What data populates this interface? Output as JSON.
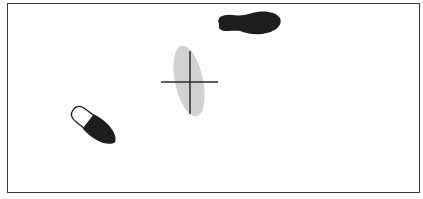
{
  "diagram": {
    "frame": {
      "border_color": "#3a3a3a",
      "background": "#ffffff"
    },
    "footprints": [
      {
        "id": "top-footprint",
        "description": "dark shoe print, horizontal, heel left, toe right",
        "fill": "#1e1e1e",
        "center": [
          246,
          23
        ]
      },
      {
        "id": "bottom-left-footprint",
        "description": "shoe print, toe region outlined (white), heel region dark, angled",
        "fill": "#1e1e1e",
        "outline_fill": "#ffffff",
        "center": [
          93,
          125
        ]
      }
    ],
    "target": {
      "id": "ellipse-with-crosshair",
      "ellipse_fill": "#cfcfcf",
      "crosshair_color": "#2a2a2a",
      "center": [
        189,
        81
      ]
    }
  }
}
